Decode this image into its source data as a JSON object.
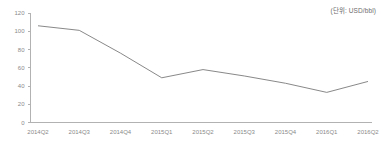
{
  "unit_label": "(단위: USD/bbl)",
  "colors": {
    "line": "#7a7a7a",
    "axis": "#b2b2b2",
    "tick_text": "#8a8a8a",
    "unit_text": "#6d6d6d",
    "background": "#ffffff"
  },
  "chart_data": {
    "type": "line",
    "title": "",
    "subtitle": "",
    "xlabel": "",
    "ylabel": "",
    "unit": "USD/bbl",
    "categories": [
      "2014Q2",
      "2014Q3",
      "2014Q4",
      "2015Q1",
      "2015Q2",
      "2015Q3",
      "2015Q4",
      "2016Q1",
      "2016Q2"
    ],
    "values": [
      106,
      101,
      76,
      49,
      58,
      51,
      43,
      33,
      45
    ],
    "series": [
      {
        "name": "Oil price",
        "values": [
          106,
          101,
          76,
          49,
          58,
          51,
          43,
          33,
          45
        ]
      }
    ],
    "ylim": [
      0,
      120
    ],
    "yticks": [
      0,
      20,
      40,
      60,
      80,
      100,
      120
    ],
    "ytick_labels": [
      "0",
      "20",
      "40",
      "60",
      "80",
      "100",
      "120"
    ],
    "xtick_labels": [
      "2014Q2",
      "2014Q3",
      "2014Q4",
      "2015Q1",
      "2015Q2",
      "2015Q3",
      "2015Q4",
      "2016Q1",
      "2016Q2"
    ],
    "grid": false,
    "legend": false,
    "legend_position": "none",
    "markers": false,
    "annotations": [
      "(단위: USD/bbl)"
    ]
  }
}
